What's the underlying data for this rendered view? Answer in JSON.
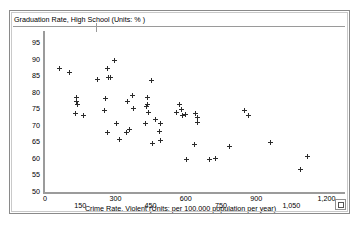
{
  "window": {
    "resize_grip_icon": "resize-grip-icon"
  },
  "chart_data": {
    "type": "scatter",
    "title": "Graduation Rate, High School (Units: % )",
    "xlabel": "Crime Rate, Violent (Units: per 100,000 population per year)",
    "ylabel": "Graduation Rate, High School (Units: % )",
    "xlim": [
      0,
      1270
    ],
    "ylim": [
      50,
      98
    ],
    "grid": false,
    "legend": null,
    "marker": "plus",
    "marker_color": "#2b2b2b",
    "xticks": [
      0,
      150,
      300,
      450,
      600,
      750,
      900,
      1050,
      1200
    ],
    "xtick_labels": [
      "0",
      "150",
      "300",
      "450",
      "600",
      "750",
      "900",
      "1,050",
      "1,200"
    ],
    "yticks": [
      50,
      55,
      60,
      65,
      70,
      75,
      80,
      85,
      90,
      95
    ],
    "ytick_labels": [
      "50",
      "55",
      "60",
      "65",
      "70",
      "75",
      "80",
      "85",
      "90",
      "95"
    ],
    "points": [
      [
        62,
        87.3
      ],
      [
        105,
        86.2
      ],
      [
        134,
        78.4
      ],
      [
        136,
        77.4
      ],
      [
        140,
        76.3
      ],
      [
        128,
        73.6
      ],
      [
        163,
        73.2
      ],
      [
        222,
        84.0
      ],
      [
        265,
        87.2
      ],
      [
        270,
        84.6
      ],
      [
        281,
        84.5
      ],
      [
        259,
        78.1
      ],
      [
        255,
        74.6
      ],
      [
        297,
        89.8
      ],
      [
        267,
        68.1
      ],
      [
        303,
        70.6
      ],
      [
        316,
        65.7
      ],
      [
        347,
        68.1
      ],
      [
        362,
        68.8
      ],
      [
        352,
        77.4
      ],
      [
        372,
        79.0
      ],
      [
        376,
        75.2
      ],
      [
        438,
        78.5
      ],
      [
        437,
        76.3
      ],
      [
        434,
        75.7
      ],
      [
        440,
        73.9
      ],
      [
        430,
        70.8
      ],
      [
        454,
        83.6
      ],
      [
        470,
        72.0
      ],
      [
        458,
        64.5
      ],
      [
        494,
        70.8
      ],
      [
        489,
        68.2
      ],
      [
        492,
        65.4
      ],
      [
        560,
        74.1
      ],
      [
        573,
        76.3
      ],
      [
        583,
        74.8
      ],
      [
        588,
        73.2
      ],
      [
        600,
        73.4
      ],
      [
        602,
        59.7
      ],
      [
        640,
        73.6
      ],
      [
        652,
        72.5
      ],
      [
        651,
        70.9
      ],
      [
        638,
        64.3
      ],
      [
        700,
        59.9
      ],
      [
        727,
        60.2
      ],
      [
        786,
        63.6
      ],
      [
        849,
        74.7
      ],
      [
        866,
        73.1
      ],
      [
        962,
        64.8
      ],
      [
        1120,
        60.8
      ],
      [
        1089,
        56.8
      ]
    ]
  }
}
